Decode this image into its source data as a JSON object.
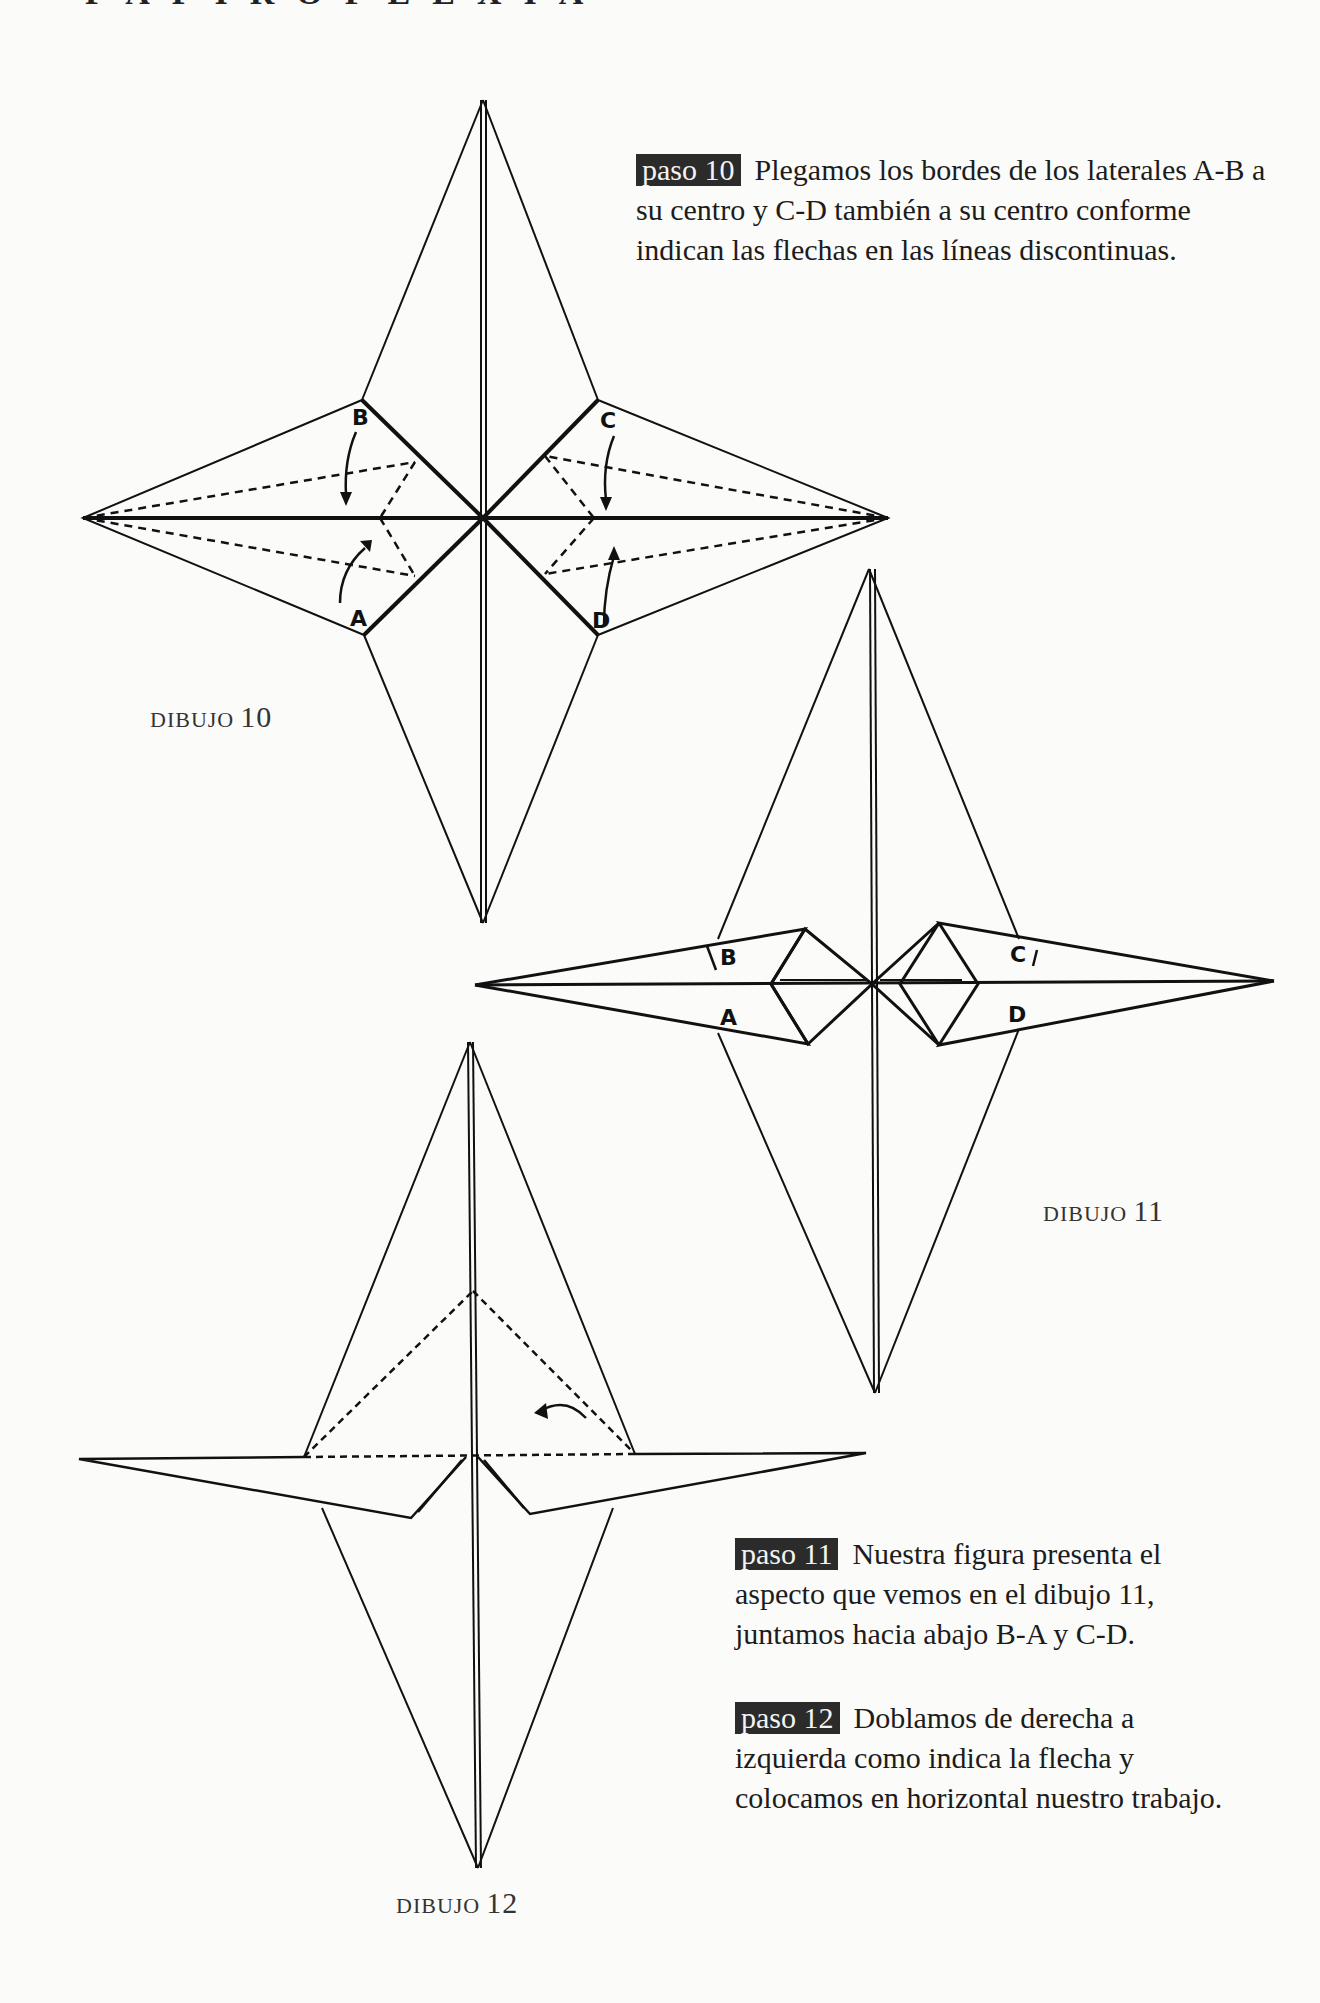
{
  "header": {
    "title": "PAPIROFLEXIA"
  },
  "steps": [
    {
      "badge": "paso 10",
      "text": "Plegamos los bordes de los laterales A-B a su centro y C-D también a su centro conforme indican las flechas en las líneas discontinuas."
    },
    {
      "badge": "paso 11",
      "text": "Nuestra figura presenta el aspecto que vemos en el dibujo 11, juntamos hacia abajo B-A y C-D."
    },
    {
      "badge": "paso 12",
      "text": "Doblamos de derecha a izquierda como indica la flecha y colocamos en horizontal nuestro trabajo."
    }
  ],
  "drawings": [
    {
      "label": "DIBUJO",
      "number": "10",
      "points": [
        "A",
        "B",
        "C",
        "D"
      ]
    },
    {
      "label": "DIBUJO",
      "number": "11",
      "points": [
        "A",
        "B",
        "C",
        "D"
      ]
    },
    {
      "label": "DIBUJO",
      "number": "12"
    }
  ]
}
